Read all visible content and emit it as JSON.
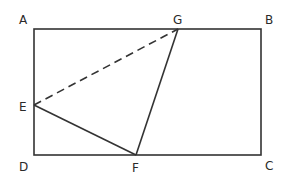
{
  "diagram": {
    "type": "geometry",
    "stroke_color": "#333333",
    "points": {
      "A": {
        "label": "A",
        "x": 34,
        "y": 29
      },
      "B": {
        "label": "B",
        "x": 261,
        "y": 29
      },
      "C": {
        "label": "C",
        "x": 261,
        "y": 155
      },
      "D": {
        "label": "D",
        "x": 34,
        "y": 155
      },
      "E": {
        "label": "E",
        "x": 34,
        "y": 105
      },
      "F": {
        "label": "F",
        "x": 136,
        "y": 155
      },
      "G": {
        "label": "G",
        "x": 178,
        "y": 29
      }
    },
    "segments": [
      {
        "from": "A",
        "to": "B",
        "style": "solid"
      },
      {
        "from": "B",
        "to": "C",
        "style": "solid"
      },
      {
        "from": "C",
        "to": "D",
        "style": "solid"
      },
      {
        "from": "D",
        "to": "A",
        "style": "solid"
      },
      {
        "from": "E",
        "to": "F",
        "style": "solid"
      },
      {
        "from": "F",
        "to": "G",
        "style": "solid"
      },
      {
        "from": "E",
        "to": "G",
        "style": "dashed"
      }
    ],
    "labels": {
      "A": "A",
      "B": "B",
      "C": "C",
      "D": "D",
      "E": "E",
      "F": "F",
      "G": "G"
    }
  }
}
